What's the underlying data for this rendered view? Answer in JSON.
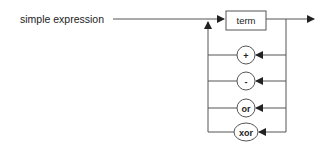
{
  "diagram": {
    "title": "simple expression",
    "term_box": "term",
    "operators": [
      {
        "label": "+",
        "y": 55
      },
      {
        "label": "-",
        "y": 81
      },
      {
        "label": "or",
        "y": 108
      },
      {
        "label": "xor",
        "y": 132
      }
    ],
    "colors": {
      "line": "#555555",
      "text": "#222222",
      "background": "#ffffff"
    }
  }
}
